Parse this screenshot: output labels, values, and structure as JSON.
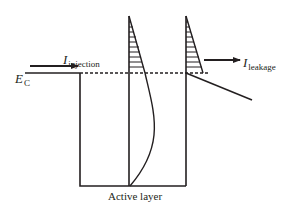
{
  "diagram": {
    "type": "band-diagram",
    "colors": {
      "line": "#231f20",
      "background": "#ffffff"
    },
    "labels": {
      "injection": {
        "symbol": "I",
        "subscript": "injection"
      },
      "leakage": {
        "symbol": "I",
        "subscript": "leakage"
      },
      "conduction_band": {
        "symbol": "E",
        "subscript": "C"
      },
      "active_layer": "Active layer"
    },
    "elements": [
      "conduction-band-edge",
      "quantum-well",
      "barrier-walls",
      "fermi-dashed-level",
      "hatched-distribution-left",
      "hatched-distribution-right",
      "carrier-density-curve",
      "injection-arrow",
      "leakage-arrow",
      "band-slope-line"
    ]
  }
}
